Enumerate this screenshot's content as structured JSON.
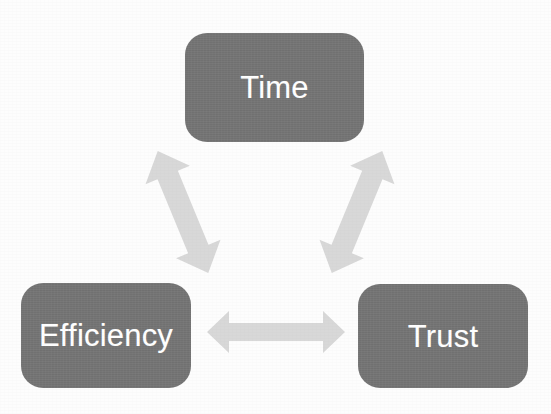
{
  "diagram": {
    "type": "cycle-triangle",
    "background_color": "#ffffff",
    "node_fill_color": "#767676",
    "node_text_color": "#ffffff",
    "arrow_fill_color": "#d8d8d8",
    "nodes": [
      {
        "id": "time",
        "label": "Time",
        "position": "top-center",
        "shape": "rounded-rectangle"
      },
      {
        "id": "efficiency",
        "label": "Efficiency",
        "position": "bottom-left",
        "shape": "rounded-rectangle"
      },
      {
        "id": "trust",
        "label": "Trust",
        "position": "bottom-right",
        "shape": "rounded-rectangle"
      }
    ],
    "connectors": [
      {
        "id": "time-efficiency",
        "from": "time",
        "to": "efficiency",
        "style": "double-headed-block-arrow",
        "orientation": "diagonal-down-left"
      },
      {
        "id": "time-trust",
        "from": "time",
        "to": "trust",
        "style": "double-headed-block-arrow",
        "orientation": "diagonal-down-right"
      },
      {
        "id": "efficiency-trust",
        "from": "efficiency",
        "to": "trust",
        "style": "double-headed-block-arrow",
        "orientation": "horizontal"
      }
    ]
  }
}
